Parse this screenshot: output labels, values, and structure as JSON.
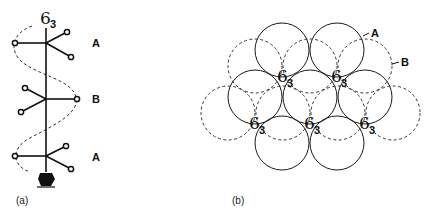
{
  "panel_a": {
    "caption": "(a)",
    "axis_label": {
      "main": "6",
      "sub": "3"
    },
    "layers": [
      {
        "label": "A"
      },
      {
        "label": "B"
      },
      {
        "label": "A"
      }
    ]
  },
  "panel_b": {
    "caption": "(b)",
    "layer_labels": {
      "a": "A",
      "b": "B"
    },
    "screw_axes": [
      {
        "main": "6",
        "sub": "3"
      },
      {
        "main": "6",
        "sub": "3"
      },
      {
        "main": "6",
        "sub": "3"
      },
      {
        "main": "6",
        "sub": "3"
      },
      {
        "main": "6",
        "sub": "3"
      }
    ]
  }
}
